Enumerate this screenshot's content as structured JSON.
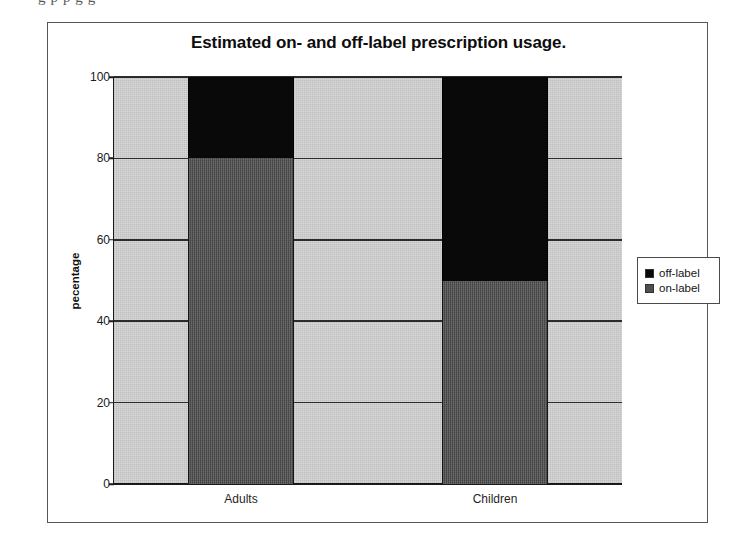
{
  "page": {
    "text_fragment_above_figure": "g                                                  p        p          g    g"
  },
  "figure": {
    "title": "Estimated on- and off-label prescription usage.",
    "legend": {
      "position": "right",
      "entries": [
        {
          "label": "off-label",
          "color": "#090909",
          "swatch_name": "legend-swatch-off-label"
        },
        {
          "label": "on-label",
          "color": "#4f4f4f",
          "swatch_name": "legend-swatch-on-label"
        }
      ]
    }
  },
  "chart_data": {
    "type": "bar",
    "stacked": true,
    "title": "Estimated on- and off-label prescription usage.",
    "xlabel": "",
    "ylabel": "pecentage",
    "categories": [
      "Adults",
      "Children"
    ],
    "series": [
      {
        "name": "on-label",
        "values": [
          80,
          50
        ],
        "color": "#4f4f4f"
      },
      {
        "name": "off-label",
        "values": [
          20,
          50
        ],
        "color": "#090909"
      }
    ],
    "ylim": [
      0,
      100
    ],
    "yticks": [
      0,
      20,
      40,
      60,
      80,
      100
    ],
    "ytick_labels": [
      "0",
      "20",
      "40",
      "60",
      "80",
      "100"
    ],
    "grid": "horizontal",
    "legend_position": "right",
    "plot_background_color": "#c9c9c9"
  }
}
